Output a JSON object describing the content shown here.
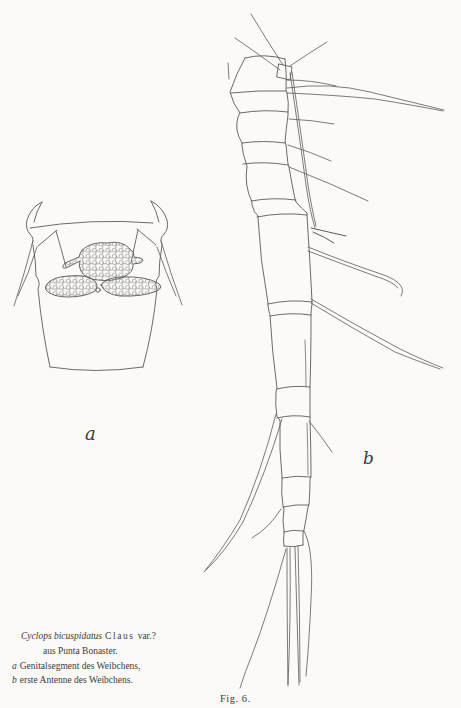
{
  "figure": {
    "label_a": "a",
    "label_b": "b",
    "fig_number": "Fig. 6."
  },
  "caption": {
    "species": "Cyclops bicuspidatus",
    "author": "Claus",
    "variant": "var.?",
    "locality": "aus Punta Bonaster.",
    "items": [
      {
        "marker": "a",
        "text": "Genitalsegment des Weibchens,"
      },
      {
        "marker": "b",
        "text": "erste Antenne des Weibchens."
      }
    ]
  },
  "colors": {
    "paper": "#fbfaf7",
    "ink": "#5a5a5a",
    "ink_dark": "#3a3a3a"
  }
}
